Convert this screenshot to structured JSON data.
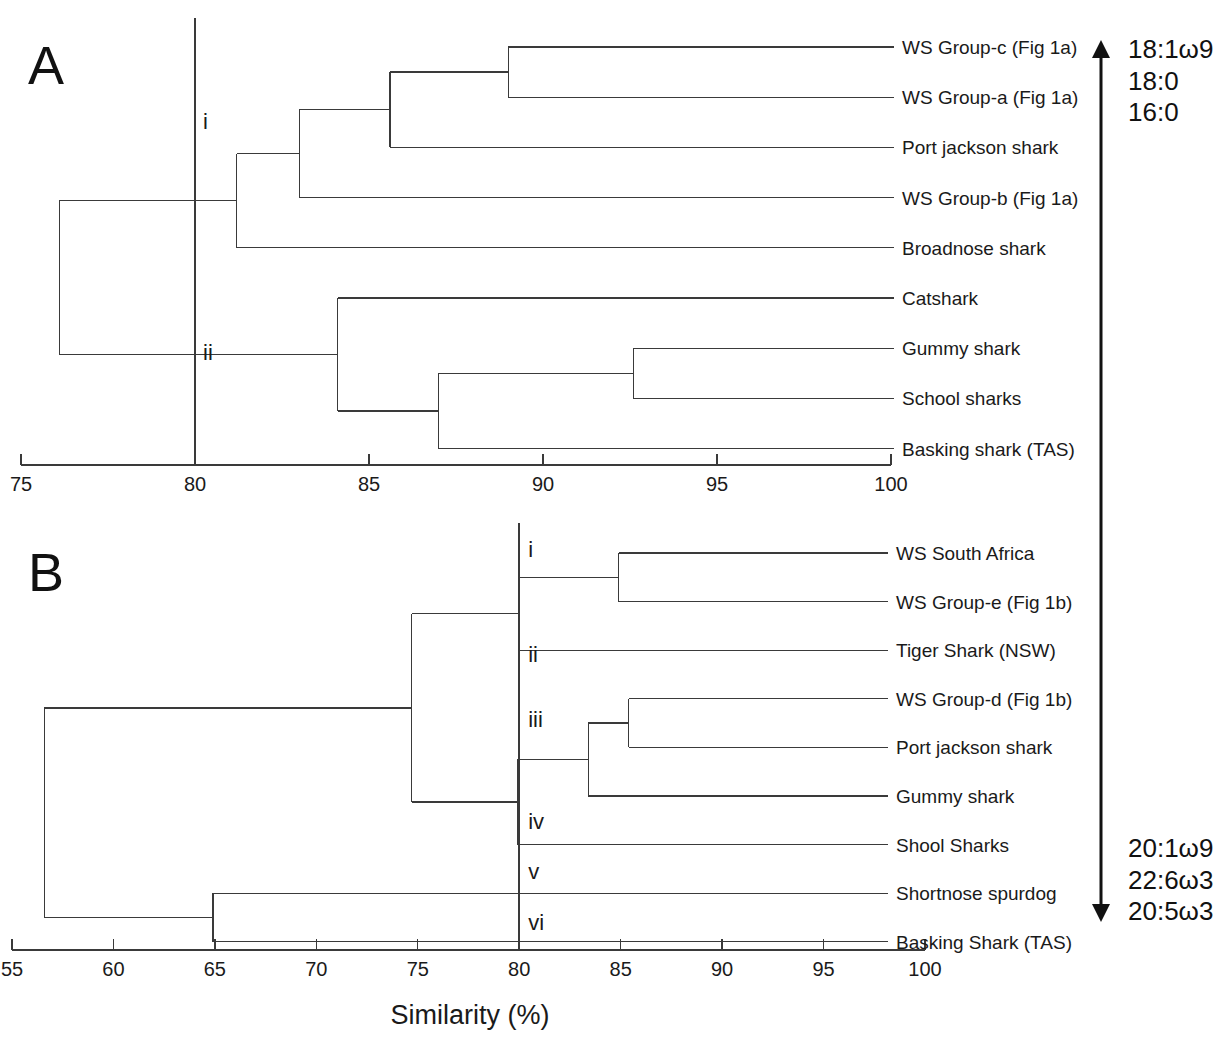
{
  "figure": {
    "axis_title": "Similarity (%)",
    "panels": [
      {
        "letter": "A"
      },
      {
        "letter": "B"
      }
    ]
  },
  "fatty_acids": {
    "top": [
      "18:1ω9",
      "18:0",
      "16:0"
    ],
    "bottom": [
      "20:1ω9",
      "22:6ω3",
      "20:5ω3"
    ]
  },
  "panel_a": {
    "letter": "A",
    "threshold": 80,
    "axis": {
      "min": 75,
      "max": 100,
      "ticks": [
        75,
        80,
        85,
        90,
        95,
        100
      ],
      "tick_labels": [
        "75",
        "80",
        "85",
        "90",
        "95",
        "100"
      ]
    },
    "node_labels": [
      {
        "id": "i",
        "text": "i",
        "similarity": 80.6
      },
      {
        "id": "ii",
        "text": "ii",
        "similarity": 80.6
      }
    ],
    "leaves": [
      {
        "index": 0,
        "label": "WS Group-c (Fig 1a)"
      },
      {
        "index": 1,
        "label": "WS Group-a (Fig 1a)"
      },
      {
        "index": 2,
        "label": "Port jackson shark"
      },
      {
        "index": 3,
        "label": "WS Group-b (Fig 1a)"
      },
      {
        "index": 4,
        "label": "Broadnose shark"
      },
      {
        "index": 5,
        "label": "Catshark"
      },
      {
        "index": 6,
        "label": "Gummy shark"
      },
      {
        "index": 7,
        "label": "School sharks"
      },
      {
        "index": 8,
        "label": "Basking shark (TAS)"
      }
    ],
    "merges": [
      {
        "name": "WS Group-c + WS Group-a",
        "similarity": 89.0,
        "children": [
          0,
          1
        ]
      },
      {
        "name": "(c,a) + Port jackson shark",
        "similarity": 85.6,
        "children": [
          "WS Group-c + WS Group-a",
          2
        ]
      },
      {
        "name": "((c,a),PJ) + WS Group-b",
        "similarity": 83.0,
        "children": [
          "(c,a) + Port jackson shark",
          3
        ]
      },
      {
        "name": "cluster-i + Broadnose shark",
        "similarity": 81.2,
        "children": [
          "((c,a),PJ) + WS Group-b",
          4
        ]
      },
      {
        "name": "Gummy shark + School sharks",
        "similarity": 92.6,
        "children": [
          6,
          7
        ]
      },
      {
        "name": "(Gummy,School) + Basking shark",
        "similarity": 87.0,
        "children": [
          "Gummy shark + School sharks",
          8
        ]
      },
      {
        "name": "cluster-ii + Catshark",
        "similarity": 84.1,
        "children": [
          "(Gummy,School) + Basking shark",
          5
        ]
      },
      {
        "name": "root",
        "similarity": 76.1,
        "children": [
          "cluster-i + Broadnose shark",
          "cluster-ii + Catshark"
        ]
      }
    ]
  },
  "panel_b": {
    "letter": "B",
    "threshold": 80,
    "axis": {
      "min": 55,
      "max": 100,
      "ticks": [
        55,
        60,
        65,
        70,
        75,
        80,
        85,
        90,
        95,
        100
      ],
      "tick_labels": [
        "55",
        "60",
        "65",
        "70",
        "75",
        "80",
        "85",
        "90",
        "95",
        "100"
      ]
    },
    "node_labels": [
      {
        "id": "i",
        "text": "i",
        "similarity": 80.4
      },
      {
        "id": "ii",
        "text": "ii",
        "similarity": 80.4
      },
      {
        "id": "iii",
        "text": "iii",
        "similarity": 80.4
      },
      {
        "id": "iv",
        "text": "iv",
        "similarity": 80.4
      },
      {
        "id": "v",
        "text": "v",
        "similarity": 80.4
      },
      {
        "id": "vi",
        "text": "vi",
        "similarity": 80.4
      }
    ],
    "leaves": [
      {
        "index": 0,
        "label": "WS South Africa"
      },
      {
        "index": 1,
        "label": "WS Group-e (Fig 1b)"
      },
      {
        "index": 2,
        "label": "Tiger Shark (NSW)"
      },
      {
        "index": 3,
        "label": "WS Group-d (Fig 1b)"
      },
      {
        "index": 4,
        "label": "Port jackson shark"
      },
      {
        "index": 5,
        "label": "Gummy shark"
      },
      {
        "index": 6,
        "label": "Shool Sharks"
      },
      {
        "index": 7,
        "label": "Shortnose spurdog"
      },
      {
        "index": 8,
        "label": "Basking Shark (TAS)"
      }
    ],
    "merges": [
      {
        "name": "WS South Africa + WS Group-e",
        "similarity": 84.9,
        "children": [
          0,
          1
        ]
      },
      {
        "name": "(SA,e) + Tiger Shark",
        "similarity": 80.0,
        "children": [
          "WS South Africa + WS Group-e",
          2
        ]
      },
      {
        "name": "WS Group-d + Port jackson shark",
        "similarity": 85.4,
        "children": [
          3,
          4
        ]
      },
      {
        "name": "(d,PJ) + Gummy shark",
        "similarity": 83.4,
        "children": [
          "WS Group-d + Port jackson shark",
          5
        ]
      },
      {
        "name": "cluster-iii + Shool Sharks",
        "similarity": 79.9,
        "children": [
          "(d,PJ) + Gummy shark",
          6
        ]
      },
      {
        "name": "upper clade",
        "similarity": 74.7,
        "children": [
          "(SA,e) + Tiger Shark",
          "cluster-iii + Shool Sharks"
        ]
      },
      {
        "name": "Shortnose spurdog + Basking Shark",
        "similarity": 64.9,
        "children": [
          7,
          8
        ]
      },
      {
        "name": "root",
        "similarity": 56.6,
        "children": [
          "upper clade",
          "Shortnose spurdog + Basking Shark"
        ]
      }
    ]
  }
}
